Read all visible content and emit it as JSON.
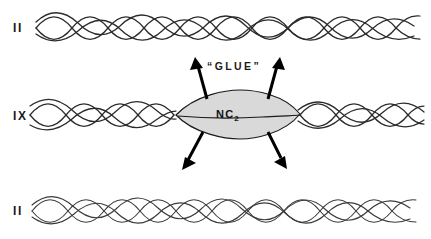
{
  "figure": {
    "background_color": "#ffffff",
    "width": 431,
    "height": 239
  },
  "rows": [
    {
      "id": "row-1",
      "label": "II",
      "center_y": 27,
      "strand_color": "#2b2b2b",
      "strand_count": 4,
      "state": "paired-unglued"
    },
    {
      "id": "row-2",
      "label": "IX",
      "center_y": 115,
      "strand_color": "#2b2b2b",
      "strand_count": 4,
      "state": "glued-at-center"
    },
    {
      "id": "row-3",
      "label": "II",
      "center_y": 210,
      "strand_color": "#3a3a3a",
      "strand_count": 4,
      "state": "paired-unglued"
    }
  ],
  "blob": {
    "label": "NC",
    "label_subscript": "2",
    "fill_color": "#d9d9d9",
    "stroke_color": "#1a1a1a",
    "center_x": 238,
    "center_y": 114,
    "half_width": 62,
    "half_height": 20
  },
  "annotations": {
    "glue_label": "“GLUE”",
    "arrow_color": "#000000",
    "arrow_count": 4,
    "arrow_directions": [
      "up-left",
      "up-right",
      "down-left",
      "down-right"
    ]
  },
  "colors": {
    "ink": "#1a1a1a",
    "strand": "#2b2b2b",
    "strand_light": "#3a3a3a",
    "blob_fill": "#d9d9d9",
    "page": "#ffffff"
  }
}
